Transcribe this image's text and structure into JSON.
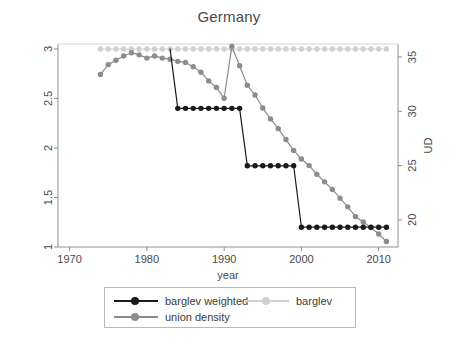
{
  "chart_data": {
    "type": "line",
    "title": "Germany",
    "xlabel": "year",
    "ylabel": "",
    "ylabel_right": "UD",
    "xlim": [
      1968.5,
      2012.5
    ],
    "ylim": [
      1,
      3.05
    ],
    "ylim_right": [
      17.5,
      36.2
    ],
    "grid": false,
    "legend_position": "below",
    "xticks": [
      1970,
      1980,
      1990,
      2000,
      2010
    ],
    "yticks_left": [
      "1",
      "1.5",
      "2",
      "2.5",
      "3"
    ],
    "yticks_right": [
      "20",
      "25",
      "30",
      "35"
    ],
    "series": [
      {
        "name": "barglev weighted",
        "axis": "left",
        "color": "#1a1a1a",
        "marker": "circle",
        "x": [
          1984,
          1985,
          1986,
          1987,
          1988,
          1989,
          1990,
          1991,
          1992,
          1993,
          1994,
          1995,
          1996,
          1997,
          1998,
          1999,
          2000,
          2001,
          2002,
          2003,
          2004,
          2005,
          2006,
          2007,
          2008,
          2009,
          2010,
          2011
        ],
        "values": [
          2.4,
          2.4,
          2.4,
          2.4,
          2.4,
          2.4,
          2.4,
          2.4,
          2.4,
          1.82,
          1.82,
          1.82,
          1.82,
          1.82,
          1.82,
          1.82,
          1.2,
          1.2,
          1.2,
          1.2,
          1.2,
          1.2,
          1.2,
          1.2,
          1.2,
          1.2,
          1.2,
          1.2
        ],
        "prefix_x": [
          1983
        ],
        "prefix_values": [
          3.0
        ]
      },
      {
        "name": "barglev",
        "axis": "left",
        "color": "#cfcfcf",
        "marker": "circle",
        "x": [
          1974,
          1975,
          1976,
          1977,
          1978,
          1979,
          1980,
          1981,
          1982,
          1983,
          1984,
          1985,
          1986,
          1987,
          1988,
          1989,
          1990,
          1991,
          1992,
          1993,
          1994,
          1995,
          1996,
          1997,
          1998,
          1999,
          2000,
          2001,
          2002,
          2003,
          2004,
          2005,
          2006,
          2007,
          2008,
          2009,
          2010,
          2011
        ],
        "values": [
          3,
          3,
          3,
          3,
          3,
          3,
          3,
          3,
          3,
          3,
          3,
          3,
          3,
          3,
          3,
          3,
          3,
          3,
          3,
          3,
          3,
          3,
          3,
          3,
          3,
          3,
          3,
          3,
          3,
          3,
          3,
          3,
          3,
          3,
          3,
          3,
          3,
          3
        ]
      },
      {
        "name": "union density",
        "axis": "right",
        "color": "#8c8c8c",
        "marker": "circle",
        "x": [
          1974,
          1975,
          1976,
          1977,
          1978,
          1979,
          1980,
          1981,
          1982,
          1983,
          1984,
          1985,
          1986,
          1987,
          1988,
          1989,
          1990,
          1991,
          1992,
          1993,
          1994,
          1995,
          1996,
          1997,
          1998,
          1999,
          2000,
          2001,
          2002,
          2003,
          2004,
          2005,
          2006,
          2007,
          2008,
          2009,
          2010,
          2011
        ],
        "values": [
          33.4,
          34.3,
          34.7,
          35.1,
          35.4,
          35.2,
          34.9,
          35.1,
          34.9,
          34.8,
          34.6,
          34.5,
          34.1,
          33.6,
          32.8,
          32.2,
          31.2,
          36.0,
          34.2,
          32.4,
          31.5,
          30.3,
          29.3,
          28.4,
          27.4,
          26.4,
          25.6,
          25.0,
          24.2,
          23.5,
          22.8,
          22.0,
          21.2,
          20.3,
          19.8,
          19.3,
          18.7,
          18.0
        ]
      }
    ]
  },
  "legend": {
    "entries": [
      {
        "label": "barglev weighted",
        "color": "#1a1a1a"
      },
      {
        "label": "barglev",
        "color": "#cfcfcf"
      },
      {
        "label": "union density",
        "color": "#8c8c8c"
      }
    ]
  },
  "axes": {
    "x_title": "year",
    "y_right_title": "UD"
  }
}
